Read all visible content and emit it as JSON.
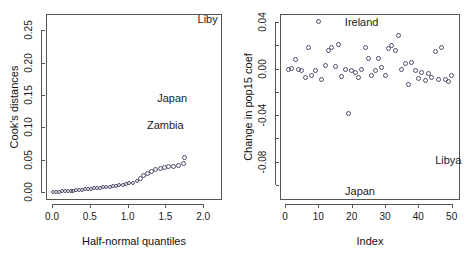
{
  "figure": {
    "background": "#ffffff",
    "point_color": "#4d4d6b",
    "axis_color": "#555555",
    "text_color": "#1a1a1a"
  },
  "chart_data": [
    {
      "type": "scatter",
      "panel": "left",
      "title": "",
      "xlabel": "Half-normal quantiles",
      "ylabel": "Cook's distances",
      "xlim": [
        -0.08,
        2.25
      ],
      "ylim": [
        -0.012,
        0.275
      ],
      "xticks": [
        0.0,
        0.5,
        1.0,
        1.5,
        2.0
      ],
      "xticklabels": [
        "0.0",
        "0.5",
        "1.0",
        "1.5",
        "2.0"
      ],
      "yticks": [
        0.0,
        0.05,
        0.1,
        0.15,
        0.2,
        0.25
      ],
      "yticklabels": [
        "0.00",
        "0.05",
        "0.10",
        "0.15",
        "0.20",
        "0.25"
      ],
      "grid": false,
      "legend": "none",
      "x": [
        0.0187,
        0.0563,
        0.094,
        0.1317,
        0.1695,
        0.2074,
        0.2454,
        0.2836,
        0.3219,
        0.3604,
        0.3991,
        0.438,
        0.4772,
        0.5167,
        0.5565,
        0.5966,
        0.6371,
        0.678,
        0.7194,
        0.7612,
        0.8035,
        0.8464,
        0.8899,
        0.9341,
        0.979,
        1.0247,
        1.0713,
        1.1188,
        1.1674,
        1.2171,
        1.2681,
        1.3205,
        1.3745,
        1.4303,
        1.4881,
        1.5482,
        1.6109,
        1.6767,
        1.7461,
        1.75
      ],
      "y": [
        0.0003,
        0.0006,
        0.0009,
        0.0012,
        0.0015,
        0.0018,
        0.0021,
        0.0025,
        0.0029,
        0.0033,
        0.0038,
        0.0043,
        0.0048,
        0.0053,
        0.0058,
        0.0064,
        0.007,
        0.0076,
        0.0082,
        0.0088,
        0.0095,
        0.0102,
        0.011,
        0.0119,
        0.0128,
        0.0138,
        0.015,
        0.0175,
        0.0215,
        0.0258,
        0.0295,
        0.0325,
        0.0348,
        0.0365,
        0.038,
        0.0392,
        0.0403,
        0.0415,
        0.0442,
        0.054
      ],
      "annotations": [
        {
          "text": "Liby",
          "x": 2.06,
          "y": 0.268,
          "note": "clipped at panel edge"
        },
        {
          "text": "Japan",
          "x": 1.59,
          "y": 0.146
        },
        {
          "text": "Zambia",
          "x": 1.5,
          "y": 0.104
        }
      ]
    },
    {
      "type": "scatter",
      "panel": "right",
      "title": "",
      "xlabel": "Index",
      "ylabel": "Change in pop15 coef",
      "xlim": [
        -1.5,
        52.5
      ],
      "ylim": [
        -0.113,
        0.047
      ],
      "xticks": [
        0,
        10,
        20,
        30,
        40,
        50
      ],
      "xticklabels": [
        "0",
        "10",
        "20",
        "30",
        "40",
        "50"
      ],
      "yticks": [
        0.04,
        0.0,
        -0.04,
        -0.08
      ],
      "yticklabels": [
        "0.04",
        "0.00",
        "-0.04",
        "-0.08"
      ],
      "yminorticks": [
        0.02,
        -0.02,
        -0.06,
        -0.1
      ],
      "grid": false,
      "legend": "none",
      "x": [
        1,
        2,
        3,
        4,
        5,
        6,
        7,
        8,
        9,
        10,
        11,
        12,
        13,
        14,
        15,
        16,
        17,
        18,
        19,
        20,
        21,
        22,
        23,
        24,
        25,
        26,
        27,
        28,
        29,
        30,
        31,
        32,
        33,
        34,
        35,
        36,
        37,
        38,
        39,
        40,
        41,
        42,
        43,
        44,
        45,
        46,
        47,
        48,
        49,
        50
      ],
      "y": [
        -0.001,
        0.0005,
        0.0075,
        -0.0005,
        -0.0015,
        -0.0075,
        0.0185,
        -0.006,
        -0.002,
        0.0405,
        -0.0095,
        0.003,
        0.016,
        0.018,
        0.0015,
        0.021,
        -0.0065,
        -0.001,
        -0.039,
        -0.002,
        -0.0035,
        -0.008,
        -0.0005,
        0.0185,
        0.009,
        -0.006,
        -0.0015,
        0.009,
        0.001,
        -0.006,
        0.017,
        0.0195,
        0.0155,
        0.0285,
        -0.001,
        0.004,
        -0.014,
        0.005,
        -0.002,
        -0.0085,
        -0.003,
        -0.0105,
        -0.0045,
        -0.0075,
        0.015,
        -0.009,
        0.0185,
        -0.0095,
        -0.011,
        -0.0055
      ],
      "annotations": [
        {
          "text": "Ireland",
          "x": 23.0,
          "y": 0.0405
        },
        {
          "text": "Libya",
          "x": 49.0,
          "y": -0.079,
          "note": "clipped at panel edge"
        },
        {
          "text": "Japan",
          "x": 22.5,
          "y": -0.1055
        }
      ]
    }
  ]
}
